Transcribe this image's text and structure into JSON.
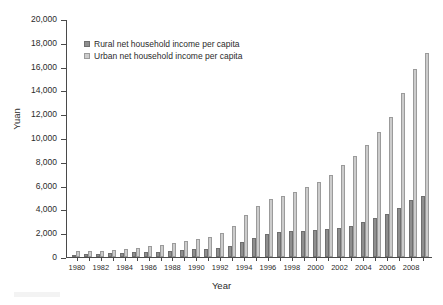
{
  "chart_data": {
    "type": "bar",
    "title": "",
    "xlabel": "Year",
    "ylabel": "Yuan",
    "ylim": [
      0,
      20000
    ],
    "ytick_step": 2000,
    "grid": false,
    "legend_position": "top-left-inside",
    "yticks": [
      0,
      2000,
      4000,
      6000,
      8000,
      10000,
      12000,
      14000,
      16000,
      18000,
      20000
    ],
    "ytick_labels": [
      "0",
      "2,000",
      "4,000",
      "6,000",
      "8,000",
      "10,000",
      "12,000",
      "14,000",
      "16,000",
      "18,000",
      "20,000"
    ],
    "categories": [
      1980,
      1981,
      1982,
      1983,
      1984,
      1985,
      1986,
      1987,
      1988,
      1989,
      1990,
      1991,
      1992,
      1993,
      1994,
      1995,
      1996,
      1997,
      1998,
      1999,
      2000,
      2001,
      2002,
      2003,
      2004,
      2005,
      2006,
      2007,
      2008,
      2009
    ],
    "xtick_labels": [
      "1980",
      "1982",
      "1984",
      "1986",
      "1988",
      "1990",
      "1992",
      "1994",
      "1996",
      "1998",
      "2000",
      "2002",
      "2004",
      "2006",
      "2008"
    ],
    "series": [
      {
        "name": "Rural net household income per capita",
        "color": "#8e8e8e",
        "values": [
          191,
          223,
          270,
          310,
          355,
          398,
          424,
          463,
          545,
          602,
          686,
          709,
          784,
          922,
          1221,
          1578,
          1926,
          2090,
          2162,
          2210,
          2253,
          2366,
          2476,
          2622,
          2936,
          3255,
          3587,
          4140,
          4761,
          5153
        ]
      },
      {
        "name": "Urban net household income per capita",
        "color": "#cccccc",
        "values": [
          478,
          500,
          535,
          565,
          652,
          739,
          900,
          1002,
          1181,
          1376,
          1510,
          1701,
          2027,
          2577,
          3496,
          4283,
          4839,
          5160,
          5425,
          5854,
          6280,
          6860,
          7703,
          8472,
          9422,
          10493,
          11760,
          13786,
          15781,
          17175
        ]
      }
    ],
    "annotations": []
  },
  "axes": {
    "y_title": "Yuan",
    "x_title": "Year"
  },
  "legend": {
    "items": [
      {
        "label": "Rural net household income per capita",
        "swatch": "rural"
      },
      {
        "label": "Urban net household income per capita",
        "swatch": "urban"
      }
    ]
  }
}
